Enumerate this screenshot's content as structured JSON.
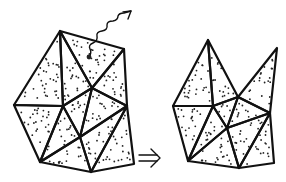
{
  "figure": {
    "type": "triangulated-mesh-transformation",
    "colors": {
      "stroke": "#111111",
      "fill": "#ffffff",
      "dots": "#222222"
    }
  },
  "left_mesh": {
    "vertices": {
      "A": [
        60,
        31
      ],
      "B": [
        124,
        49
      ],
      "C": [
        14,
        105
      ],
      "D": [
        63,
        106
      ],
      "E": [
        92,
        88
      ],
      "F": [
        80,
        137
      ],
      "G": [
        127,
        106
      ],
      "H": [
        40,
        162
      ],
      "I": [
        91,
        172
      ],
      "J": [
        134,
        164
      ]
    },
    "triangles": [
      [
        "A",
        "B",
        "E"
      ],
      [
        "A",
        "E",
        "D"
      ],
      [
        "A",
        "D",
        "C"
      ],
      [
        "B",
        "G",
        "E"
      ],
      [
        "E",
        "G",
        "F"
      ],
      [
        "E",
        "F",
        "D"
      ],
      [
        "C",
        "D",
        "H"
      ],
      [
        "D",
        "F",
        "H"
      ],
      [
        "H",
        "F",
        "I"
      ],
      [
        "F",
        "G",
        "I"
      ],
      [
        "G",
        "J",
        "I"
      ]
    ],
    "annotation": {
      "marker_dot": [
        89,
        57
      ],
      "wavy_arrow": "escaping particle leaving the top triangle",
      "arrowhead_at": [
        131,
        11
      ]
    }
  },
  "right_mesh": {
    "vertices": {
      "P": [
        208,
        40
      ],
      "Q": [
        277,
        48
      ],
      "R": [
        173,
        106
      ],
      "S": [
        213,
        106
      ],
      "T": [
        238,
        97
      ],
      "U": [
        227,
        128
      ],
      "V": [
        270,
        113
      ],
      "W": [
        188,
        161
      ],
      "X": [
        239,
        168
      ],
      "Y": [
        274,
        163
      ]
    },
    "triangles": [
      [
        "P",
        "T",
        "S"
      ],
      [
        "P",
        "S",
        "R"
      ],
      [
        "T",
        "Q",
        "V"
      ],
      [
        "T",
        "V",
        "U"
      ],
      [
        "T",
        "U",
        "S"
      ],
      [
        "R",
        "S",
        "W"
      ],
      [
        "S",
        "U",
        "W"
      ],
      [
        "W",
        "U",
        "X"
      ],
      [
        "U",
        "V",
        "X"
      ],
      [
        "V",
        "Y",
        "X"
      ]
    ]
  },
  "transition_arrow": {
    "symbol": "double-arrow",
    "position": [
      146,
      158
    ]
  }
}
